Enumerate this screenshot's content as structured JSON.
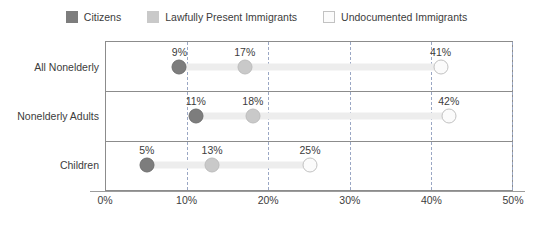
{
  "chart_data": {
    "type": "scatter",
    "title": "",
    "subtitle": "",
    "xlabel": "",
    "ylabel": "",
    "xlim": [
      0,
      50
    ],
    "xticks": [
      "0%",
      "10%",
      "20%",
      "30%",
      "40%",
      "50%"
    ],
    "xtick_values": [
      0,
      10,
      20,
      30,
      40,
      50
    ],
    "grid": true,
    "grid_style": "dashed-vertical",
    "legend_position": "top-center",
    "categories": [
      "All Nonelderly",
      "Nonelderly Adults",
      "Children"
    ],
    "series": [
      {
        "name": "Citizens",
        "color": "#7d7d7d",
        "values": [
          9,
          11,
          5
        ],
        "labels": [
          "9%",
          "11%",
          "5%"
        ]
      },
      {
        "name": "Lawfully Present Immigrants",
        "color": "#c9c9c9",
        "values": [
          17,
          18,
          13
        ],
        "labels": [
          "17%",
          "18%",
          "13%"
        ]
      },
      {
        "name": "Undocumented Immigrants",
        "color": "#fbfbfb",
        "values": [
          41,
          42,
          25
        ],
        "labels": [
          "41%",
          "42%",
          "25%"
        ]
      }
    ]
  },
  "legend": {
    "items": [
      {
        "label": "Citizens",
        "color": "#7d7d7d"
      },
      {
        "label": "Lawfully Present Immigrants",
        "color": "#c9c9c9"
      },
      {
        "label": "Undocumented Immigrants",
        "color": "#fbfbfb"
      }
    ]
  },
  "axis": {
    "ticks": [
      "0%",
      "10%",
      "20%",
      "30%",
      "40%",
      "50%"
    ]
  },
  "rows": [
    {
      "label": "All Nonelderly",
      "points": [
        {
          "series": "Citizens",
          "value": 9,
          "label": "9%"
        },
        {
          "series": "Lawfully Present Immigrants",
          "value": 17,
          "label": "17%"
        },
        {
          "series": "Undocumented Immigrants",
          "value": 41,
          "label": "41%"
        }
      ]
    },
    {
      "label": "Nonelderly Adults",
      "points": [
        {
          "series": "Citizens",
          "value": 11,
          "label": "11%"
        },
        {
          "series": "Lawfully Present Immigrants",
          "value": 18,
          "label": "18%"
        },
        {
          "series": "Undocumented Immigrants",
          "value": 42,
          "label": "42%"
        }
      ]
    },
    {
      "label": "Children",
      "points": [
        {
          "series": "Citizens",
          "value": 5,
          "label": "5%"
        },
        {
          "series": "Lawfully Present Immigrants",
          "value": 13,
          "label": "13%"
        },
        {
          "series": "Undocumented Immigrants",
          "value": 25,
          "label": "25%"
        }
      ]
    }
  ]
}
